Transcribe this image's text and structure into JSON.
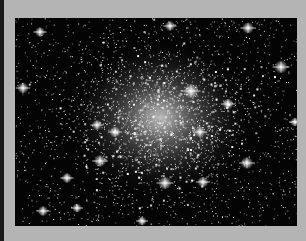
{
  "image": {
    "subject": "globular star cluster",
    "alt": "Dense field of stars concentrated toward a bright core",
    "colors": {
      "background": "#040404",
      "frame": "#b4b4b4",
      "stars": "#ffffff"
    },
    "core": {
      "cx": 145,
      "cy": 100
    },
    "bright_stars": [
      {
        "x": 155,
        "y": 8,
        "r": 2.2
      },
      {
        "x": 233,
        "y": 10,
        "r": 2.5
      },
      {
        "x": 25,
        "y": 14,
        "r": 2.2
      },
      {
        "x": 266,
        "y": 49,
        "r": 2.8
      },
      {
        "x": 8,
        "y": 70,
        "r": 2.4
      },
      {
        "x": 176,
        "y": 73,
        "r": 3.2
      },
      {
        "x": 213,
        "y": 86,
        "r": 2.4
      },
      {
        "x": 82,
        "y": 107,
        "r": 2.2
      },
      {
        "x": 100,
        "y": 114,
        "r": 2.4
      },
      {
        "x": 185,
        "y": 114,
        "r": 2.4
      },
      {
        "x": 85,
        "y": 143,
        "r": 2.6
      },
      {
        "x": 232,
        "y": 145,
        "r": 2.6
      },
      {
        "x": 52,
        "y": 160,
        "r": 2.2
      },
      {
        "x": 150,
        "y": 165,
        "r": 2.8
      },
      {
        "x": 188,
        "y": 164,
        "r": 2.4
      },
      {
        "x": 28,
        "y": 193,
        "r": 2.2
      },
      {
        "x": 62,
        "y": 190,
        "r": 2
      },
      {
        "x": 127,
        "y": 203,
        "r": 2
      },
      {
        "x": 280,
        "y": 104,
        "r": 2
      }
    ]
  }
}
